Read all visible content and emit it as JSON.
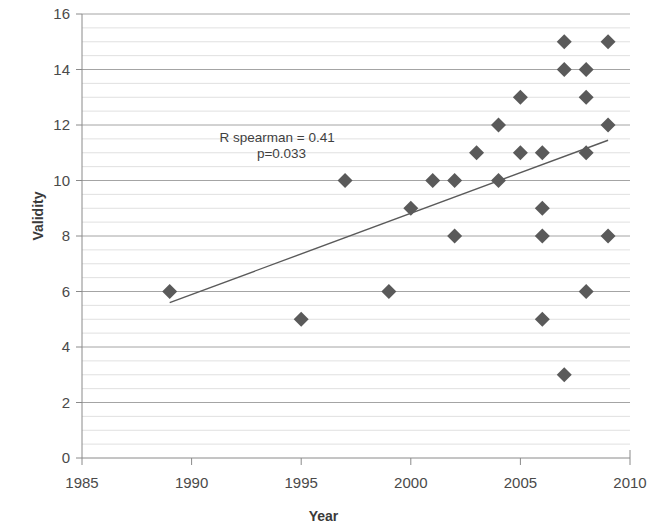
{
  "chart_data": {
    "type": "scatter",
    "title": "",
    "xlabel": "Year",
    "ylabel": "Validity",
    "xlim": [
      1985,
      2010
    ],
    "ylim": [
      0,
      16
    ],
    "x_ticks": [
      1985,
      1990,
      1995,
      2000,
      2005,
      2010
    ],
    "y_ticks": [
      0,
      2,
      4,
      6,
      8,
      10,
      12,
      14,
      16
    ],
    "grid": "horizontal-major-and-minor",
    "minor_y_step": 0.5,
    "legend": "none",
    "marker": "diamond",
    "marker_color": "#5a5a5a",
    "points": [
      {
        "x": 1989,
        "y": 6
      },
      {
        "x": 1995,
        "y": 5
      },
      {
        "x": 1997,
        "y": 10
      },
      {
        "x": 1999,
        "y": 6
      },
      {
        "x": 2000,
        "y": 9
      },
      {
        "x": 2001,
        "y": 10
      },
      {
        "x": 2002,
        "y": 10
      },
      {
        "x": 2002,
        "y": 8
      },
      {
        "x": 2003,
        "y": 11
      },
      {
        "x": 2004,
        "y": 12
      },
      {
        "x": 2004,
        "y": 10
      },
      {
        "x": 2005,
        "y": 13
      },
      {
        "x": 2005,
        "y": 11
      },
      {
        "x": 2006,
        "y": 11
      },
      {
        "x": 2006,
        "y": 9
      },
      {
        "x": 2006,
        "y": 8
      },
      {
        "x": 2006,
        "y": 5
      },
      {
        "x": 2007,
        "y": 15
      },
      {
        "x": 2007,
        "y": 14
      },
      {
        "x": 2007,
        "y": 3
      },
      {
        "x": 2008,
        "y": 14
      },
      {
        "x": 2008,
        "y": 13
      },
      {
        "x": 2008,
        "y": 11
      },
      {
        "x": 2008,
        "y": 6
      },
      {
        "x": 2009,
        "y": 15
      },
      {
        "x": 2009,
        "y": 12
      },
      {
        "x": 2009,
        "y": 8
      }
    ],
    "trendline": {
      "type": "linear",
      "x_start": 1989,
      "y_start": 5.6,
      "x_end": 2009,
      "y_end": 11.45,
      "color": "#5a5a5a"
    },
    "annotations": [
      {
        "text": "R spearman = 0.41",
        "x": 1993.9,
        "y": 11.4
      },
      {
        "text": "p=0.033",
        "x": 1994.1,
        "y": 10.8
      }
    ]
  },
  "axes": {
    "y_title": "Validity",
    "x_title": "Year",
    "x_tick_labels": [
      "1985",
      "1990",
      "1995",
      "2000",
      "2005",
      "2010"
    ],
    "y_tick_labels": [
      "0",
      "2",
      "4",
      "6",
      "8",
      "10",
      "12",
      "14",
      "16"
    ]
  },
  "stats": {
    "spearman_label": "R spearman = 0.41",
    "p_label": "p=0.033"
  },
  "colors": {
    "marker": "#5a5a5a",
    "trendline": "#5a5a5a",
    "major_grid": "#9a9a9a",
    "minor_grid": "#d8d8d8",
    "axis": "#8a8a8a",
    "text": "#3f3f3f"
  }
}
